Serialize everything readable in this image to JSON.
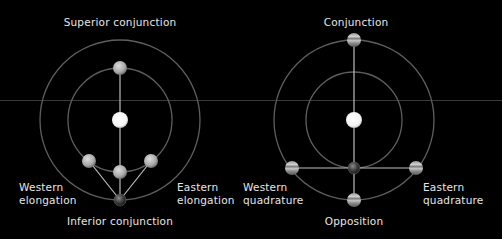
{
  "colors": {
    "background": "#000000",
    "orbit": "#6a6a6a",
    "line": "#bdbdbd",
    "text": "#e6e6e6",
    "sun": "#ffffff",
    "guide_line": "#3a3a3a"
  },
  "inferior_planet_diagram": {
    "labels": {
      "top": "Superior conjunction",
      "bottom": "Inferior conjunction",
      "left_line1": "Western",
      "left_line2": "elongation",
      "right_line1": "Eastern",
      "right_line2": "elongation"
    },
    "objects": [
      "sun",
      "inner-planet-superior",
      "inner-planet-inferior",
      "inner-planet-western",
      "inner-planet-eastern",
      "earth"
    ]
  },
  "superior_planet_diagram": {
    "labels": {
      "top": "Conjunction",
      "bottom": "Opposition",
      "left_line1": "Western",
      "left_line2": "quadrature",
      "right_line1": "Eastern",
      "right_line2": "quadrature"
    },
    "objects": [
      "sun",
      "earth",
      "outer-planet-conjunction",
      "outer-planet-opposition",
      "outer-planet-western",
      "outer-planet-eastern"
    ]
  }
}
